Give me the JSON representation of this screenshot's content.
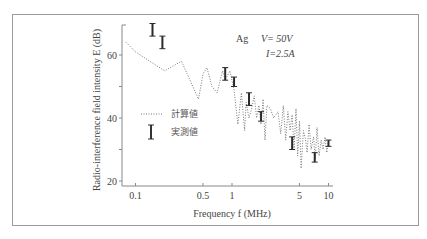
{
  "chart_data": {
    "type": "line",
    "title": "",
    "annotations": {
      "material": "Ag",
      "voltage": "V= 50V",
      "current": "I=2.5A"
    },
    "xlabel": "Frequency f (MHz)",
    "ylabel": "Radio-interference field intensity E (dB)",
    "xscale": "log",
    "xlim": [
      0.075,
      11
    ],
    "ylim": [
      18,
      70
    ],
    "x_ticks": [
      0.1,
      0.5,
      1,
      5,
      10
    ],
    "x_tick_labels": [
      "0.1",
      "0.5",
      "1",
      "5",
      "10"
    ],
    "y_ticks": [
      20,
      30,
      40,
      50,
      60
    ],
    "y_tick_labels": [
      "20",
      "",
      "40",
      "",
      "60"
    ],
    "grid": false,
    "legend": {
      "position": "inside-left",
      "entries": [
        {
          "label": "計算値",
          "style": "dotted-line"
        },
        {
          "label": "実測値",
          "style": "error-bar"
        }
      ]
    },
    "series": [
      {
        "name": "計算値",
        "style": "dotted",
        "x": [
          0.08,
          0.1,
          0.2,
          0.3,
          0.45,
          0.5,
          0.55,
          0.62,
          0.7,
          0.8,
          0.85,
          0.95,
          1.05,
          1.15,
          1.25,
          1.35,
          1.4,
          1.5,
          1.6,
          1.7,
          1.8,
          1.9,
          2.0,
          2.1,
          2.2,
          2.3,
          2.5,
          2.7,
          3.0,
          3.2,
          3.4,
          3.6,
          3.8,
          4.0,
          4.2,
          4.4,
          4.6,
          4.8,
          5.0,
          5.2,
          5.5,
          5.8,
          6.0,
          6.3,
          6.6,
          7.0,
          7.3,
          7.6,
          8.0,
          8.4,
          8.8,
          9.2,
          9.6,
          10.0
        ],
        "y": [
          64,
          61,
          55,
          58,
          46,
          54,
          56,
          50,
          48,
          55,
          52,
          55,
          49,
          38,
          48,
          36,
          45,
          40,
          43,
          47,
          40,
          44,
          38,
          46,
          33,
          44,
          43,
          40,
          42,
          35,
          44,
          33,
          42,
          36,
          41,
          30,
          43,
          28,
          39,
          24,
          36,
          33,
          29,
          38,
          30,
          34,
          27,
          37,
          28,
          33,
          30,
          34,
          29,
          33
        ]
      },
      {
        "name": "実測値",
        "style": "error-bar",
        "x": [
          0.15,
          0.19,
          0.85,
          1.05,
          1.5,
          2.0,
          4.2,
          7.2,
          10.0
        ],
        "y_low": [
          66,
          62,
          52,
          50,
          44,
          39,
          30,
          26,
          31
        ],
        "y_high": [
          70,
          66,
          56,
          53,
          48,
          42,
          34,
          29,
          33
        ]
      }
    ]
  }
}
